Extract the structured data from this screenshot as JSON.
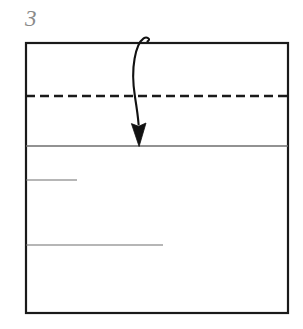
{
  "figure": {
    "step_label": "3",
    "caption": "",
    "type": "origami-fold-diagram",
    "colors": {
      "background": "#ffffff",
      "outline": "#1a1a1a",
      "crease_solid": "#6e6e6e",
      "crease_dashed": "#1a1a1a",
      "arrow": "#111111",
      "label": "#8a8a8a"
    },
    "sheet": {
      "name": "paper-outline",
      "shape": "rectangle",
      "x": 26,
      "y": 43,
      "width": 262,
      "height": 270,
      "stroke_width": 2.2
    },
    "creases": [
      {
        "name": "dashed-valley-crease",
        "style": "dashed",
        "orientation": "horizontal",
        "y": 96,
        "x1": 26,
        "x2": 288,
        "stroke_width": 2.4,
        "dash": "9 5"
      },
      {
        "name": "solid-fold-edge",
        "style": "solid",
        "orientation": "horizontal",
        "y": 146,
        "x1": 26,
        "x2": 288,
        "stroke_width": 1.3
      },
      {
        "name": "short-crease-upper",
        "style": "solid",
        "orientation": "horizontal",
        "y": 180,
        "x1": 26,
        "x2": 77,
        "stroke_width": 1.1
      },
      {
        "name": "short-crease-lower",
        "style": "solid",
        "orientation": "horizontal",
        "y": 245,
        "x1": 26,
        "x2": 163,
        "stroke_width": 1.1
      }
    ],
    "arrow": {
      "name": "fold-direction-arrow",
      "description": "curved downward fold arrow with small loop at origin",
      "start_x": 146,
      "start_y": 40,
      "tip_x": 139,
      "tip_y": 145,
      "path": "M 147.5 41.5 C 151.5 39.2 146.8 36.2 143.6 38.4 C 139.6 41.2 136.4 48.5 134.6 58.5 C 132.4 70.5 132.9 84.0 135.0 97.0 C 136.6 107.0 138.0 116.5 138.6 124.5",
      "head_path": "M 139.1 146.5 L 131.4 123.6 L 138.6 126.3 L 146.0 123.0 Z",
      "stroke_width": 2.1
    }
  }
}
